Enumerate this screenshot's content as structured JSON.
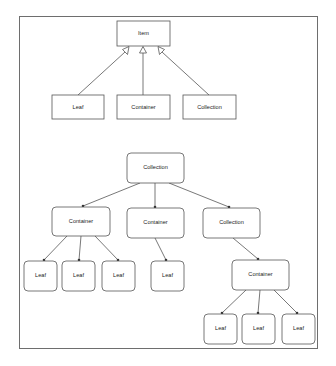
{
  "diagram": {
    "type": "composite-pattern",
    "class_diagram": {
      "base": {
        "id": "item",
        "label": "Item"
      },
      "subclasses": [
        {
          "id": "leaf",
          "label": "Leaf"
        },
        {
          "id": "container",
          "label": "Container"
        },
        {
          "id": "collection",
          "label": "Collection"
        }
      ],
      "relation": "inherits (hollow triangle arrow)"
    },
    "object_tree": {
      "root": {
        "id": "root",
        "label": "Collection"
      },
      "level2": [
        {
          "id": "c1",
          "label": "Container"
        },
        {
          "id": "c2",
          "label": "Container"
        },
        {
          "id": "col1",
          "label": "Collection"
        }
      ],
      "level3": [
        {
          "id": "l1",
          "label": "Leaf",
          "parent": "c1"
        },
        {
          "id": "l2",
          "label": "Leaf",
          "parent": "c1"
        },
        {
          "id": "l3",
          "label": "Leaf",
          "parent": "c1"
        },
        {
          "id": "l4",
          "label": "Leaf",
          "parent": "c2"
        },
        {
          "id": "c3",
          "label": "Container",
          "parent": "col1"
        }
      ],
      "level4": [
        {
          "id": "l5",
          "label": "Leaf",
          "parent": "c3"
        },
        {
          "id": "l6",
          "label": "Leaf",
          "parent": "c3"
        },
        {
          "id": "l7",
          "label": "Leaf",
          "parent": "c3"
        }
      ],
      "relation": "contains (solid arrow)"
    }
  }
}
